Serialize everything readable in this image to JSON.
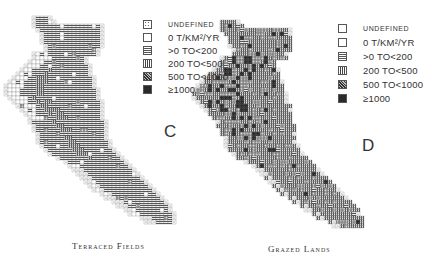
{
  "figure": {
    "panels": [
      {
        "id": "C",
        "letter": "C",
        "title": "Terraced Fields",
        "legend": [
          {
            "key": "undefined",
            "label": "UNDEFINED"
          },
          {
            "key": "zero",
            "label": "0 T/KM²/YR"
          },
          {
            "key": "lt200",
            "label": ">0 TO<200"
          },
          {
            "key": "lt500",
            "label": "200 TO<500"
          },
          {
            "key": "lt1000",
            "label": "500 TO<1000"
          },
          {
            "key": "ge1000",
            "label": "≥1000"
          }
        ]
      },
      {
        "id": "D",
        "letter": "D",
        "title": "Grazed Lands",
        "legend": [
          {
            "key": "undefined",
            "label": "UNDEFINED"
          },
          {
            "key": "zero",
            "label": "0 T/KM²/YR"
          },
          {
            "key": "lt200",
            "label": ">0 TO<200"
          },
          {
            "key": "lt500",
            "label": "200 TO<500"
          },
          {
            "key": "lt1000",
            "label": "500 TO<1000"
          },
          {
            "key": "ge1000",
            "label": "≥1000"
          }
        ]
      }
    ],
    "units": "t/km²/yr",
    "classes": [
      "undefined",
      "0",
      ">0 to <200",
      "200 to <500",
      "500 to <1000",
      "≥1000"
    ]
  }
}
